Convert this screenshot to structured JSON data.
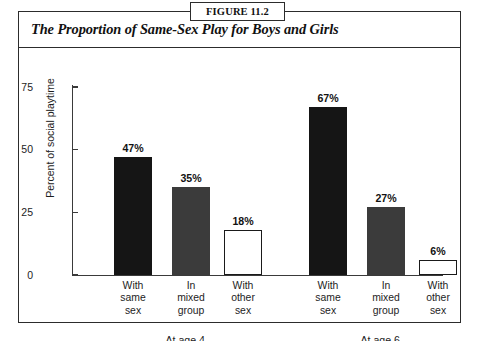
{
  "figure": {
    "tab_label": "FIGURE 11.2",
    "title": "The Proportion of Same-Sex Play for Boys and Girls"
  },
  "chart_data": {
    "type": "bar",
    "title": "The Proportion of Same-Sex Play for Boys and Girls",
    "xlabel": "",
    "ylabel": "Percent of social playtime",
    "ylim": [
      0,
      75
    ],
    "yticks": [
      0,
      25,
      50,
      75
    ],
    "ytick_labels": [
      "0",
      "25",
      "50",
      "75"
    ],
    "grid": false,
    "legend": false,
    "categories": [
      "With same sex",
      "In mixed group",
      "With other sex"
    ],
    "groups": [
      {
        "label": "At age 4",
        "label_fraction_num": "1",
        "label_fraction_den": "2",
        "bars": [
          {
            "category": "With same sex",
            "line1": "With",
            "line2": "same",
            "line3": "sex",
            "value": 47,
            "value_label": "47%",
            "fill": "solid",
            "color": "#151515"
          },
          {
            "category": "In mixed group",
            "line1": "In",
            "line2": "mixed",
            "line3": "group",
            "value": 35,
            "value_label": "35%",
            "fill": "gray",
            "color": "#3b3b3b"
          },
          {
            "category": "With other sex",
            "line1": "With",
            "line2": "other",
            "line3": "sex",
            "value": 18,
            "value_label": "18%",
            "fill": "hollow",
            "color": "#ffffff"
          }
        ]
      },
      {
        "label": "At age 6",
        "label_fraction_num": "1",
        "label_fraction_den": "2",
        "bars": [
          {
            "category": "With same sex",
            "line1": "With",
            "line2": "same",
            "line3": "sex",
            "value": 67,
            "value_label": "67%",
            "fill": "solid",
            "color": "#151515"
          },
          {
            "category": "In mixed group",
            "line1": "In",
            "line2": "mixed",
            "line3": "group",
            "value": 27,
            "value_label": "27%",
            "fill": "gray",
            "color": "#3b3b3b"
          },
          {
            "category": "With other sex",
            "line1": "With",
            "line2": "other",
            "line3": "sex",
            "value": 6,
            "value_label": "6%",
            "fill": "hollow",
            "color": "#ffffff"
          }
        ]
      }
    ],
    "colors": {
      "solid": "#151515",
      "gray": "#3b3b3b",
      "hollow_fill": "#ffffff",
      "hollow_stroke": "#1a1a1a",
      "axis": "#3a3a3a",
      "frame": "#2c2c2c",
      "background": "#ffffff"
    }
  }
}
